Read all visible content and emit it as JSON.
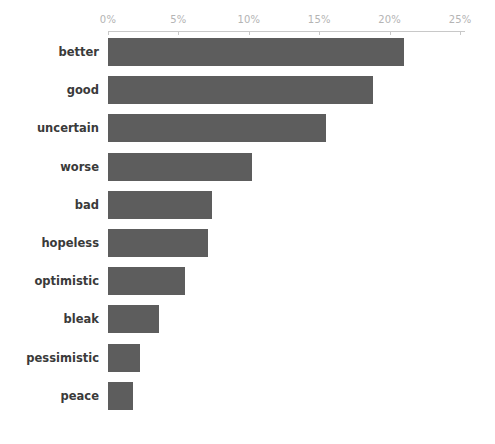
{
  "chart_data": {
    "type": "bar",
    "orientation": "horizontal",
    "title": "",
    "subtitle": "",
    "xlabel": "",
    "ylabel": "",
    "xlim": [
      0,
      25.35
    ],
    "grid": false,
    "legend": null,
    "axis_position": "top",
    "value_suffix": "%",
    "bar_color": "#5d5d5d",
    "axis_color": "#c8c8c8",
    "tick_label_color": "#b4b4b4",
    "category_label_color": "#3a3a3a",
    "tick_labels": [
      "0%",
      "5%",
      "10%",
      "15%",
      "20%",
      "25%"
    ],
    "tick_values": [
      0,
      5,
      10,
      15,
      20,
      25
    ],
    "categories": [
      "better",
      "good",
      "uncertain",
      "worse",
      "bad",
      "hopeless",
      "optimistic",
      "bleak",
      "pessimistic",
      "peace"
    ],
    "values": [
      21.0,
      18.8,
      15.5,
      10.2,
      7.4,
      7.1,
      5.5,
      3.6,
      2.3,
      1.8
    ]
  }
}
